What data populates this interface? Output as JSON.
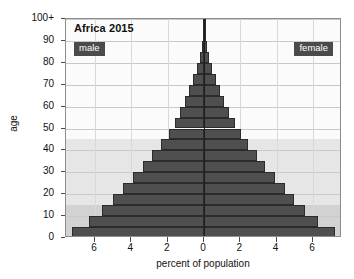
{
  "chart_data": {
    "type": "bar",
    "subtype": "population-pyramid",
    "title": "Africa 2015",
    "xlabel": "percent of population",
    "ylabel": "age",
    "xlim": [
      -7.6,
      7.6
    ],
    "ylim": [
      0,
      100
    ],
    "grid": true,
    "legend_position": "inside-top-corners",
    "xtick_labels": [
      "6",
      "4",
      "2",
      "0",
      "2",
      "4",
      "6"
    ],
    "xtick_values": [
      -6,
      -4,
      -2,
      0,
      2,
      4,
      6
    ],
    "ytick_labels": [
      "0",
      "10",
      "20",
      "30",
      "40",
      "50",
      "60",
      "70",
      "80",
      "90",
      "100+"
    ],
    "ytick_values": [
      0,
      10,
      20,
      30,
      40,
      50,
      60,
      70,
      80,
      90,
      100
    ],
    "age_group_labels": [
      "0-4",
      "5-9",
      "10-14",
      "15-19",
      "20-24",
      "25-29",
      "30-34",
      "35-39",
      "40-44",
      "45-49",
      "50-54",
      "55-59",
      "60-64",
      "65-69",
      "70-74",
      "75-79",
      "80-84",
      "85-89",
      "90-94",
      "95-99",
      "100+"
    ],
    "age_group_starts": [
      0,
      5,
      10,
      15,
      20,
      25,
      30,
      35,
      40,
      45,
      50,
      55,
      60,
      65,
      70,
      75,
      80,
      85,
      90,
      95,
      100
    ],
    "series": [
      {
        "name": "male",
        "side": "left",
        "color": "#4f4f4f",
        "values": [
          7.25,
          6.35,
          5.6,
          5.0,
          4.45,
          3.9,
          3.35,
          2.85,
          2.35,
          1.95,
          1.6,
          1.3,
          1.05,
          0.8,
          0.58,
          0.38,
          0.22,
          0.12,
          0.06,
          0.03,
          0.02
        ]
      },
      {
        "name": "female",
        "side": "right",
        "color": "#4f4f4f",
        "values": [
          7.2,
          6.3,
          5.58,
          4.98,
          4.45,
          3.92,
          3.38,
          2.9,
          2.42,
          2.02,
          1.68,
          1.38,
          1.12,
          0.88,
          0.64,
          0.44,
          0.26,
          0.14,
          0.07,
          0.03,
          0.02
        ]
      }
    ],
    "background_bands": [
      {
        "name": "youth-band",
        "age_from": 0,
        "age_to": 15,
        "color": "#d2d2d2"
      },
      {
        "name": "working-band",
        "age_from": 15,
        "age_to": 45,
        "color": "#e6e6e6"
      },
      {
        "name": "older-band",
        "age_from": 45,
        "age_to": 100,
        "color": "#fbfbfb"
      }
    ]
  },
  "legend": {
    "male_label": "male",
    "female_label": "female",
    "badge_color": "#4b4b4b"
  },
  "axes": {
    "x_title": "percent of population",
    "y_title": "age"
  }
}
